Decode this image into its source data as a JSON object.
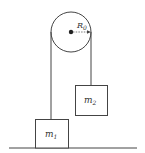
{
  "diagram": {
    "pulley": {
      "label": "R",
      "label_sub": "0"
    },
    "mass1": {
      "label": "m",
      "label_sub": "1"
    },
    "mass2": {
      "label": "m",
      "label_sub": "2"
    },
    "colors": {
      "stroke": "#333333",
      "fill": "#ffffff"
    }
  }
}
